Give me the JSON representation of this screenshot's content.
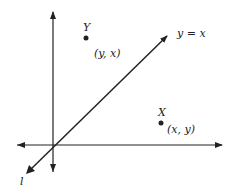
{
  "diagram": {
    "line_label": "y = x",
    "diag_line_name": "l",
    "points": [
      {
        "name": "Y",
        "coords": "(y, x)"
      },
      {
        "name": "X",
        "coords": "(x, y)"
      }
    ],
    "colors": {
      "ink": "#222222",
      "background": "#ffffff"
    }
  }
}
